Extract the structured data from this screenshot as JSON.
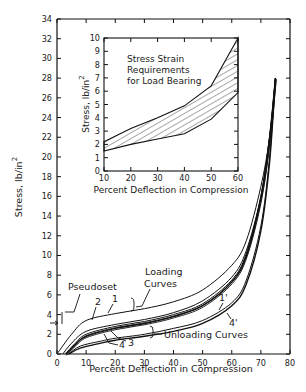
{
  "chart_data": [
    {
      "type": "line",
      "title": "",
      "xlabel": "Percent Deflection in Compression",
      "ylabel": "Stress, lb/in²",
      "xlim": [
        0,
        80
      ],
      "ylim": [
        0,
        34
      ],
      "x_ticks": [
        "0",
        "10",
        "20",
        "30",
        "40",
        "50",
        "60",
        "70",
        "80"
      ],
      "y_ticks": [
        "0",
        "2",
        "4",
        "6",
        "8",
        "10",
        "12",
        "14",
        "16",
        "18",
        "20",
        "22",
        "24",
        "26",
        "28",
        "30",
        "32",
        "34"
      ],
      "grid": false,
      "annotations": [
        "Pseudoset",
        "Loading Curves",
        "Unloading Curves",
        "1",
        "2",
        "3",
        "4",
        "1'",
        "4'"
      ],
      "series": [
        {
          "name": "1 (loading)",
          "x": [
            0,
            5,
            10,
            20,
            30,
            40,
            50,
            60,
            65,
            70,
            73,
            75
          ],
          "y": [
            0,
            2.0,
            3.4,
            4.1,
            4.6,
            5.3,
            6.5,
            9.0,
            11.5,
            17,
            22,
            28
          ]
        },
        {
          "name": "2 (loading)",
          "x": [
            2,
            5,
            10,
            20,
            30,
            40,
            50,
            60,
            65,
            70,
            73,
            75
          ],
          "y": [
            0,
            1.1,
            2.3,
            3.0,
            3.5,
            4.2,
            5.4,
            7.8,
            10.5,
            16,
            22,
            28
          ]
        },
        {
          "name": "3 (loading)",
          "x": [
            3,
            6,
            10,
            20,
            30,
            40,
            50,
            60,
            65,
            70,
            73,
            75
          ],
          "y": [
            0,
            1.0,
            2.0,
            2.8,
            3.3,
            4.0,
            5.1,
            7.5,
            10.2,
            16,
            22,
            28
          ]
        },
        {
          "name": "4 (loading)",
          "x": [
            3,
            6,
            10,
            20,
            30,
            40,
            50,
            60,
            65,
            70,
            73,
            75
          ],
          "y": [
            0,
            0.9,
            1.8,
            2.6,
            3.1,
            3.8,
            4.9,
            7.3,
            10.0,
            15.8,
            22,
            28
          ]
        },
        {
          "name": "1' (unloading)",
          "x": [
            4,
            8,
            15,
            20,
            30,
            40,
            50,
            60,
            65,
            70,
            73,
            75
          ],
          "y": [
            0,
            0.8,
            1.3,
            1.6,
            2.0,
            2.6,
            3.4,
            5.2,
            7.5,
            13,
            20,
            28
          ]
        },
        {
          "name": "4' (unloading)",
          "x": [
            4,
            8,
            15,
            20,
            30,
            40,
            50,
            60,
            65,
            70,
            73,
            75
          ],
          "y": [
            0,
            0.6,
            1.1,
            1.4,
            1.8,
            2.3,
            3.1,
            4.9,
            7.1,
            12.5,
            19.5,
            28
          ]
        }
      ]
    },
    {
      "type": "area",
      "title": "Stress Strain Requirements for Load Bearing",
      "xlabel": "Percent Deflection in Compression",
      "ylabel": "Stress, lb/in²",
      "xlim": [
        10,
        60
      ],
      "ylim": [
        0,
        10
      ],
      "x_ticks": [
        "10",
        "20",
        "30",
        "40",
        "50",
        "60"
      ],
      "y_ticks": [
        "0",
        "1",
        "2",
        "3",
        "4",
        "5",
        "6",
        "7",
        "8",
        "9",
        "10"
      ],
      "series": [
        {
          "name": "upper bound",
          "x": [
            10,
            20,
            30,
            40,
            50,
            60
          ],
          "y": [
            2.2,
            3.2,
            4.0,
            4.9,
            6.4,
            10.0
          ]
        },
        {
          "name": "lower bound",
          "x": [
            10,
            20,
            30,
            40,
            50,
            60
          ],
          "y": [
            1.5,
            2.0,
            2.4,
            2.8,
            3.9,
            5.9
          ]
        }
      ],
      "fill": "hatched"
    }
  ],
  "labels": {
    "main_xlabel": "Percent Deflection in Compression",
    "main_ylabel": "Stress, lb/in",
    "main_ylabel_sup": "2",
    "inset_xlabel": "Percent Deflection in Compression",
    "inset_ylabel": "Stress, lb/in",
    "inset_ylabel_sup": "2",
    "inset_title_1": "Stress Strain",
    "inset_title_2": "Requirements",
    "inset_title_3": "for Load Bearing",
    "pseudoset": "Pseudoset",
    "loading_1": "Loading",
    "loading_2": "Curves",
    "unloading": "Unloading Curves",
    "c1": "1",
    "c2": "2",
    "c3": "3",
    "c4": "4",
    "c1p": "1'",
    "c4p": "4'"
  },
  "ticks": {
    "main_x": [
      "0",
      "10",
      "20",
      "30",
      "40",
      "50",
      "60",
      "70",
      "80"
    ],
    "main_y": [
      "0",
      "2",
      "4",
      "6",
      "8",
      "10",
      "12",
      "14",
      "16",
      "18",
      "20",
      "22",
      "24",
      "26",
      "28",
      "30",
      "32",
      "34"
    ],
    "inset_x": [
      "10",
      "20",
      "30",
      "40",
      "50",
      "60"
    ],
    "inset_y": [
      "0",
      "1",
      "2",
      "3",
      "4",
      "5",
      "6",
      "7",
      "8",
      "9",
      "10"
    ]
  }
}
